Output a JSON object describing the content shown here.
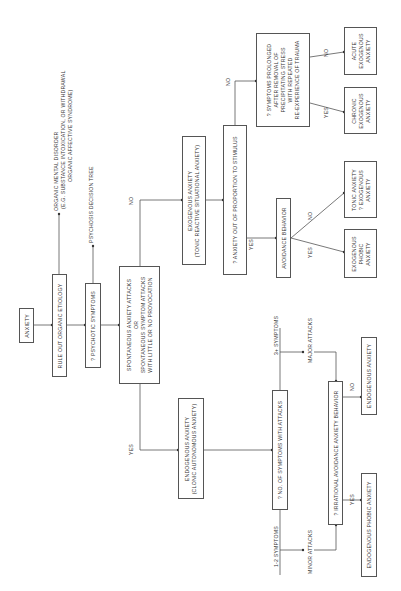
{
  "diagram": {
    "orientation": "rotated-90-ccw",
    "nodes": {
      "anxiety": "ANXIETY",
      "rule_out": "RULE OUT ORGANIC ETIOLOGY",
      "organic_out": [
        "ORGANIC MENTAL DISORDER",
        "(E.G. SUBSTANCE INTOXICATION, OR WITHDRAWAL",
        "ORGANIC AFFECTIVE SYNDROME)"
      ],
      "psychotic": "? PSYCHOTIC SYMPTOMS",
      "psychosis_out": "PSYCHOSIS DECISION TREE",
      "spontaneous": [
        "SPONTANEOUS ANXIETY ATTACKS",
        "OR",
        "SPONTANEOUS SYMPTOM ATTACKS",
        "WITH LITTLE OR NO PROVOCATION"
      ],
      "exogenous": [
        "EXOGENOUS ANXIETY",
        "(TONIC REACTIVE SITUATIONAL ANXIETY)"
      ],
      "out_of_proportion": "? ANXIETY OUT OF PROPORTION TO STIMULUS",
      "avoidance": "AVOIDANCE BEHAVIOR",
      "exogenous_phobic": [
        "EXOGENOUS",
        "PHOBIC",
        "ANXIETY"
      ],
      "tonic": [
        "TONIC ANXIETY",
        "? EXOGENOUS",
        "ANXIETY"
      ],
      "prolonged": [
        "? SYMPTOMS PROLONGED",
        "AFTER REMOVAL OF",
        "PRECIPITATING STRESS",
        "WITH REPEATED",
        "RE-EXPERIENCE OF TRAUMA"
      ],
      "acute": [
        "ACUTE",
        "EXOGENOUS",
        "ANXIETY"
      ],
      "chronic": [
        "CHRONIC",
        "EXOGENOUS",
        "ANXIETY"
      ],
      "endogenous": [
        "ENDOGENOUS ANXIETY",
        "(CLONIC AUTONOMOUS ANXIETY)"
      ],
      "no_symptoms": "? NO. OF SYMPTOMS WITH ATTACKS",
      "irrational": "? IRRATIONAL AVOIDANCE ANXIETY BEHAVIOR",
      "endogenous_out": "ENDOGENOUS ANXIETY",
      "endogenous_phobic": "ENDOGENOUS PHOBIC ANXIETY"
    },
    "edge_labels": {
      "yes": "YES",
      "no": "NO",
      "symptoms_3plus": "3+ SYMPTOMS",
      "symptoms_1_2": "1-2 SYMPTOMS",
      "major_attacks": "MAJOR ATTACKS",
      "minor_attacks": "MINOR ATTACKS"
    },
    "colors": {
      "line": "#555555",
      "text": "#333333",
      "background": "#ffffff"
    }
  }
}
